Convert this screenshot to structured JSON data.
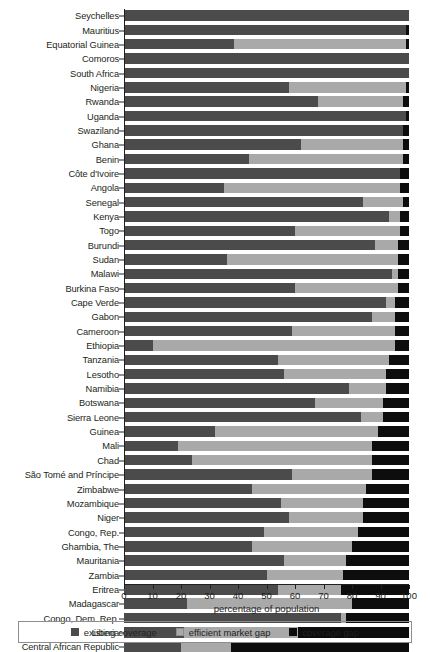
{
  "chart_data": {
    "type": "bar",
    "subtype": "stacked-horizontal",
    "title": "",
    "xlabel": "percentage of population",
    "ylabel": "",
    "xlim": [
      0,
      100
    ],
    "xticks": [
      0,
      10,
      20,
      30,
      40,
      50,
      60,
      70,
      80,
      90,
      100
    ],
    "grid": false,
    "legend_position": "bottom",
    "colors": {
      "existing coverage": "#4b4b4b",
      "efficient market gap": "#a9a9a9",
      "coverage gap": "#0d0d0d"
    },
    "categories": [
      "Seychelles",
      "Mauritius",
      "Equatorial Guinea",
      "Comoros",
      "South Africa",
      "Nigeria",
      "Rwanda",
      "Uganda",
      "Swaziland",
      "Ghana",
      "Benin",
      "Côte d'Ivoire",
      "Angola",
      "Senegal",
      "Kenya",
      "Togo",
      "Burundi",
      "Sudan",
      "Malawi",
      "Burkina Faso",
      "Cape Verde",
      "Gabon",
      "Cameroon",
      "Ethiopia",
      "Tanzania",
      "Lesotho",
      "Namibia",
      "Botswana",
      "Sierra Leone",
      "Guinea",
      "Mali",
      "Chad",
      "São Tomé and Príncipe",
      "Zimbabwe",
      "Mozambique",
      "Niger",
      "Congo, Rep.",
      "Ghambia, The",
      "Mauritania",
      "Zambia",
      "Eritrea",
      "Madagascar",
      "Congo, Dem. Rep.",
      "Liberia",
      "Central African Republic"
    ],
    "series": [
      {
        "name": "existing coverage",
        "values": [
          100,
          99,
          38.5,
          100,
          100,
          58,
          68,
          99,
          98,
          62,
          44,
          97,
          35,
          84,
          93,
          60,
          88,
          36,
          94,
          60,
          92,
          87,
          59,
          10,
          54,
          56,
          79,
          67,
          83,
          32,
          19,
          24,
          59,
          45,
          55,
          58,
          49,
          45,
          56,
          50,
          54,
          22,
          76,
          21,
          20
        ]
      },
      {
        "name": "efficient market gap",
        "values": [
          0,
          0,
          60.5,
          0,
          0,
          41,
          30,
          0,
          0,
          36,
          54,
          0,
          62,
          14,
          4,
          37,
          8,
          60,
          2,
          36,
          3,
          8,
          36,
          85,
          39,
          36,
          13,
          24,
          8,
          57,
          68,
          63,
          28,
          40,
          29,
          26,
          33,
          35,
          22,
          27,
          22,
          58,
          2,
          40,
          17.5
        ]
      },
      {
        "name": "coverage gap",
        "values": [
          0,
          1,
          1,
          0,
          0,
          1,
          2,
          1,
          2,
          2,
          2,
          3,
          3,
          2,
          3,
          3,
          4,
          4,
          4,
          4,
          5,
          5,
          5,
          5,
          7,
          8,
          8,
          9,
          9,
          11,
          13,
          13,
          13,
          15,
          16,
          16,
          18,
          20,
          22,
          23,
          24,
          20,
          22,
          39,
          62.5
        ]
      }
    ]
  },
  "legend": {
    "items": [
      {
        "label": "existing coverage",
        "swatch": "existing"
      },
      {
        "label": "efficient market gap",
        "swatch": "market"
      },
      {
        "label": "coverage gap",
        "swatch": "gap"
      }
    ]
  }
}
